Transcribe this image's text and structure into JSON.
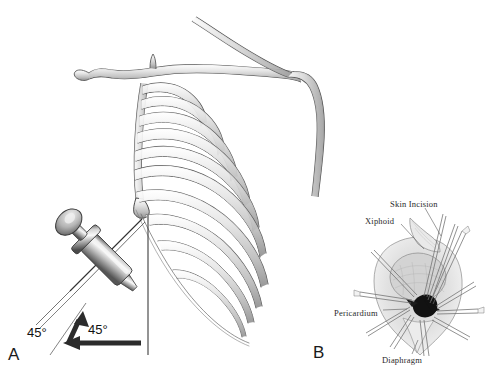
{
  "figure": {
    "background_color": "#ffffff",
    "ink_color": "#3a3a3a",
    "bone_fill_light": "#e8e8e8",
    "bone_fill_mid": "#c2c2c2",
    "bone_fill_dark": "#9a9a9a",
    "metal_light": "#f0f0f0",
    "metal_mid": "#a8a8a8",
    "metal_dark": "#5c5c5c",
    "arrow_color": "#2b2b2b"
  },
  "panel_a": {
    "letter": "A",
    "description": "Lateral view of rib cage with needle and syringe inserted below the xiphoid process",
    "angles": [
      {
        "id": "oblique",
        "value": "45°",
        "meaning": "needle elevation from skin surface"
      },
      {
        "id": "horizontal",
        "value": "45°",
        "meaning": "needle direction from midline"
      }
    ],
    "structures": [
      "clavicle",
      "scapular spine",
      "ribs",
      "costal margin",
      "xiphoid process",
      "sternum"
    ],
    "instrument": "syringe-with-needle",
    "rib_count": 10
  },
  "panel_b": {
    "letter": "B",
    "description": "Surgical subxiphoid window exposure with retractors",
    "labels": [
      {
        "id": "skin-incision",
        "text": "Skin Incision"
      },
      {
        "id": "xiphoid",
        "text": "Xiphoid"
      },
      {
        "id": "pericardium",
        "text": "Pericardium"
      },
      {
        "id": "diaphragm",
        "text": "Diaphragm"
      }
    ]
  }
}
